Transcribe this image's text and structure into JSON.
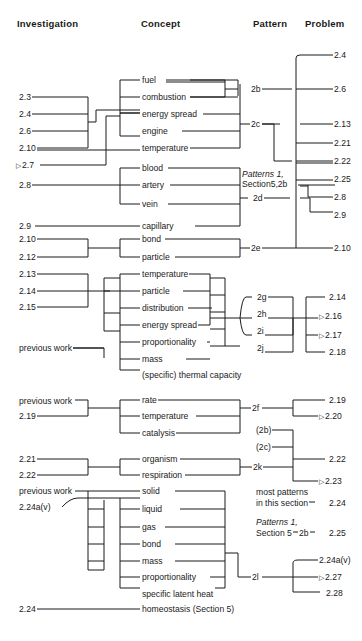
{
  "headers": {
    "investigation": "Investigation",
    "concept": "Concept",
    "pattern": "Pattern",
    "problem": "Problem"
  },
  "marker_triangle": "▷",
  "groups": [
    {
      "investigations": [
        "2.3",
        "2.4",
        "2.6",
        "2.10",
        "2.7"
      ],
      "marked_investigations": [
        "2.7"
      ],
      "concepts": [
        "fuel",
        "combustion",
        "energy spread",
        "engine",
        "temperature"
      ],
      "patterns": [
        "2b",
        "2c"
      ],
      "problems": [
        "2.4",
        "2.6",
        "2.13",
        "2.21",
        "2.22",
        "2.25",
        "2.8",
        "2.9",
        "2.10"
      ]
    },
    {
      "investigations": [
        "2.8",
        "2.9"
      ],
      "concepts": [
        "blood",
        "artery",
        "vein",
        "capillary"
      ],
      "patterns": [
        "2d"
      ],
      "note": "Patterns 1, Section5,2b"
    },
    {
      "investigations": [
        "2.10",
        "2.12"
      ],
      "concepts": [
        "bond",
        "particle"
      ],
      "patterns": [
        "2e"
      ]
    },
    {
      "investigations": [
        "2.13",
        "2.14",
        "2.15",
        "previous work"
      ],
      "concepts": [
        "temperature",
        "particle",
        "distribution",
        "energy  spread",
        "proportionality",
        "mass",
        "(specific) thermal capacity"
      ],
      "patterns": [
        "2g",
        "2h",
        "2i",
        "2j"
      ],
      "problems": [
        "2.14",
        "2.16",
        "2.17",
        "2.18"
      ],
      "marked_problems": [
        "2.16",
        "2.17"
      ]
    },
    {
      "investigations": [
        "previous work",
        "2.19"
      ],
      "concepts": [
        "rate",
        "temperature",
        "catalysis"
      ],
      "patterns": [
        "2f"
      ],
      "problems": [
        "2.19",
        "2.20"
      ],
      "marked_problems": [
        "2.20"
      ]
    },
    {
      "investigations": [
        "2.21",
        "2.22"
      ],
      "concepts": [
        "organism",
        "respiration"
      ],
      "patterns": [
        "2k",
        "(2b)",
        "(2c)"
      ],
      "problems": [
        "2.22",
        "2.23"
      ],
      "marked_problems": [
        "2.23"
      ]
    },
    {
      "investigations": [
        "previous work",
        "2.24a(v)"
      ],
      "concepts": [
        "solid",
        "liquid",
        "gas",
        "bond",
        "mass",
        "proportionality",
        "specific latent heat"
      ],
      "patterns": [
        "2l"
      ],
      "problems": [
        "2.24a(v)",
        "2.27",
        "2.28"
      ],
      "marked_problems": [
        "2.27"
      ],
      "side_notes": [
        {
          "text_line1": "most patterns",
          "text_line2": "in this section",
          "problem": "2.24"
        },
        {
          "text_line1": "Patterns 1,",
          "text_line2": "Section 5",
          "pattern": "2b",
          "problem": "2.25"
        }
      ]
    },
    {
      "investigations": [
        "2.24"
      ],
      "concepts": [
        "homeostasis (Section 5)"
      ]
    }
  ],
  "labels": {
    "inv": {
      "g1_a": "2.3",
      "g1_b": "2.4",
      "g1_c": "2.6",
      "g1_d": "2.10",
      "g1_e": "2.7",
      "g2_a": "2.8",
      "g2_b": "2.9",
      "g3_a": "2.10",
      "g3_b": "2.12",
      "g4_a": "2.13",
      "g4_b": "2.14",
      "g4_c": "2.15",
      "g4_d": "previous work",
      "g5_a": "previous work",
      "g5_b": "2.19",
      "g6_a": "2.21",
      "g6_b": "2.22",
      "g7_a": "previous work",
      "g7_b": "2.24a(v)",
      "g8_a": "2.24"
    },
    "con": {
      "fuel": "fuel",
      "combustion": "combustion",
      "energy_spread": "energy spread",
      "engine": "engine",
      "temperature": "temperature",
      "blood": "blood",
      "artery": "artery",
      "vein": "vein",
      "capillary": "capillary",
      "bond": "bond",
      "particle": "particle",
      "g4_temperature": "temperature",
      "g4_particle": "particle",
      "g4_distribution": "distribution",
      "g4_energy_spread": "energy  spread",
      "g4_proportionality": "proportionality",
      "g4_mass": "mass",
      "g4_thermal": "(specific) thermal capacity",
      "rate": "rate",
      "g5_temperature": "temperature",
      "catalysis": "catalysis",
      "organism": "organism",
      "respiration": "respiration",
      "solid": "solid",
      "liquid": "liquid",
      "gas": "gas",
      "g7_bond": "bond",
      "g7_mass": "mass",
      "g7_proportionality": "proportionality",
      "latent": "specific latent heat",
      "homeostasis": "homeostasis (Section 5)"
    },
    "pat": {
      "p2b": "2b",
      "p2c": "2c",
      "p2d": "2d",
      "p2e": "2e",
      "p2g": "2g",
      "p2h": "2h",
      "p2i": "2i",
      "p2j": "2j",
      "p2f": "2f",
      "p2b_paren": "(2b)",
      "p2c_paren": "(2c)",
      "p2k": "2k",
      "p2l": "2l",
      "note1_line1": "Patterns 1,",
      "note1_line2": "Section5,2b",
      "note2_line1": "most patterns",
      "note2_line2": "in this section",
      "note3_line1": "Patterns 1,",
      "note3_line2": "Section 5",
      "note3_pattern": "2b"
    },
    "prob": {
      "a": "2.4",
      "b": "2.6",
      "c": "2.13",
      "d": "2.21",
      "e": "2.22",
      "f": "2.25",
      "g": "2.8",
      "h": "2.9",
      "i": "2.10",
      "j": "2.14",
      "k": "2.16",
      "l": "2.17",
      "m": "2.18",
      "n": "2.19",
      "o": "2.20",
      "p": "2.22",
      "q": "2.23",
      "r": "2.24",
      "s": "2.25",
      "t": "2.24a(v)",
      "u": "2.27",
      "v": "2.28"
    }
  }
}
